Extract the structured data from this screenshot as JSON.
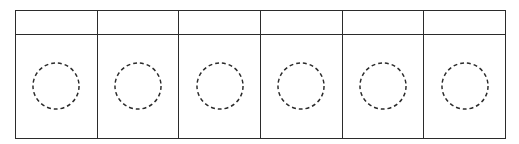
{
  "diagram": {
    "type": "table-grid",
    "columns": [
      {
        "header": "",
        "slot": "empty-circle-placeholder"
      },
      {
        "header": "",
        "slot": "empty-circle-placeholder"
      },
      {
        "header": "",
        "slot": "empty-circle-placeholder"
      },
      {
        "header": "",
        "slot": "empty-circle-placeholder"
      },
      {
        "header": "",
        "slot": "empty-circle-placeholder"
      },
      {
        "header": "",
        "slot": "empty-circle-placeholder"
      }
    ],
    "colors": {
      "stroke": "#2b2b2b",
      "background": "#ffffff"
    }
  }
}
